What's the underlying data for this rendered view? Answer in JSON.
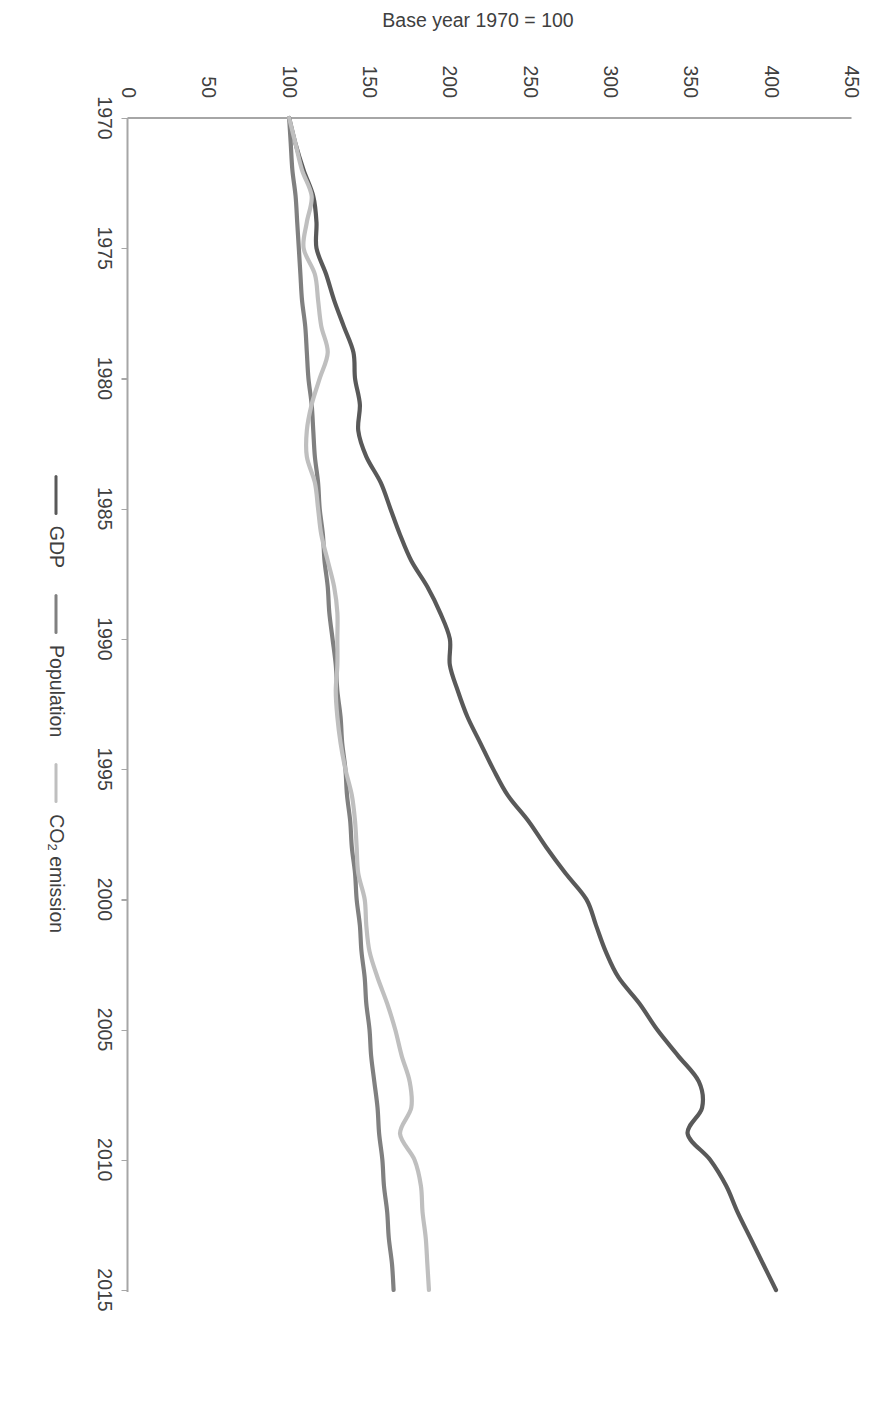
{
  "figure": {
    "y_axis_title": "Base year 1970 = 100",
    "caption": ""
  },
  "axes": {
    "y_ticks": [
      "0",
      "50",
      "100",
      "150",
      "200",
      "250",
      "300",
      "350",
      "400",
      "450"
    ],
    "x_ticks": [
      "1970",
      "1975",
      "1980",
      "1985",
      "1990",
      "1995",
      "2000",
      "2005",
      "2010",
      "2015"
    ]
  },
  "legend": {
    "items": [
      {
        "label": "GDP",
        "color": "#595959"
      },
      {
        "label": "Population",
        "color": "#808080"
      },
      {
        "label": "CO2 emission",
        "color": "#bfbfbf",
        "label_main": "CO",
        "label_sub": "2",
        "label_tail": " emission"
      }
    ]
  },
  "colors": {
    "gdp": "#595959",
    "population": "#808080",
    "co2": "#bfbfbf",
    "axis": "#a6a6a6",
    "text": "#3f3f3f",
    "background": "#ffffff"
  },
  "chart_data": {
    "type": "line",
    "title": "",
    "subtitle": "",
    "xlabel": "",
    "ylabel": "Base year 1970 = 100",
    "xlim": [
      1970,
      2015
    ],
    "ylim": [
      0,
      450
    ],
    "grid": false,
    "legend_position": "bottom",
    "x": [
      1970,
      1971,
      1972,
      1973,
      1974,
      1975,
      1976,
      1977,
      1978,
      1979,
      1980,
      1981,
      1982,
      1983,
      1984,
      1985,
      1986,
      1987,
      1988,
      1989,
      1990,
      1991,
      1992,
      1993,
      1994,
      1995,
      1996,
      1997,
      1998,
      1999,
      2000,
      2001,
      2002,
      2003,
      2004,
      2005,
      2006,
      2007,
      2008,
      2009,
      2010,
      2011,
      2012,
      2013,
      2014,
      2015
    ],
    "series": [
      {
        "name": "GDP",
        "color": "#595959",
        "values": [
          100,
          104,
          109,
          115,
          117,
          117,
          123,
          128,
          134,
          140,
          141,
          144,
          143,
          148,
          157,
          163,
          169,
          176,
          186,
          194,
          200,
          200,
          205,
          211,
          219,
          227,
          236,
          249,
          260,
          272,
          285,
          291,
          297,
          305,
          318,
          329,
          342,
          355,
          357,
          348,
          362,
          372,
          379,
          387,
          395,
          403
        ]
      },
      {
        "name": "Population",
        "color": "#808080",
        "values": [
          100,
          101,
          102,
          104,
          105,
          106,
          107,
          108,
          110,
          111,
          112,
          114,
          115,
          116,
          118,
          119,
          121,
          122,
          124,
          125,
          127,
          129,
          130,
          132,
          133,
          135,
          136,
          138,
          139,
          141,
          142,
          144,
          145,
          147,
          148,
          150,
          151,
          153,
          155,
          156,
          158,
          159,
          161,
          162,
          164,
          165
        ]
      },
      {
        "name": "CO2 emission",
        "color": "#bfbfbf",
        "values": [
          100,
          104,
          108,
          114,
          111,
          109,
          116,
          118,
          120,
          124,
          119,
          114,
          111,
          111,
          116,
          118,
          120,
          124,
          128,
          130,
          130,
          130,
          129,
          130,
          132,
          135,
          139,
          141,
          142,
          143,
          147,
          148,
          150,
          155,
          161,
          166,
          170,
          175,
          176,
          169,
          178,
          182,
          183,
          185,
          186,
          187
        ]
      }
    ]
  }
}
